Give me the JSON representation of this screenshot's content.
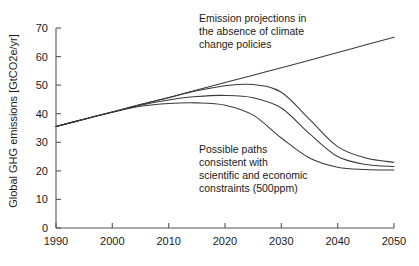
{
  "chart_data": {
    "type": "line",
    "title": "",
    "xlabel": "",
    "ylabel": "Global GHG emissions [GtCO2e/yr]",
    "xlim": [
      1990,
      2050
    ],
    "ylim": [
      0,
      70
    ],
    "xticks": [
      "1990",
      "2000",
      "2010",
      "2020",
      "2030",
      "2040",
      "2050"
    ],
    "yticks": [
      "0",
      "10",
      "20",
      "30",
      "40",
      "50",
      "60",
      "70"
    ],
    "grid": false,
    "legend": "none",
    "x": [
      1990,
      1995,
      2000,
      2005,
      2010,
      2015,
      2020,
      2025,
      2030,
      2035,
      2040,
      2045,
      2050
    ],
    "series": [
      {
        "name": "Emission projections in the absence of climate change policies",
        "values": [
          35.5,
          38.1,
          40.6,
          43.2,
          45.7,
          48.3,
          50.9,
          53.5,
          56.1,
          58.7,
          61.4,
          64.1,
          66.8
        ]
      },
      {
        "name": "Possible path A (late peak, 500ppm)",
        "values": [
          35.5,
          38.1,
          40.6,
          43.2,
          45.6,
          48.0,
          49.8,
          50.2,
          47.5,
          38.0,
          28.5,
          24.5,
          23.0
        ]
      },
      {
        "name": "Possible path B (mid peak, 500ppm)",
        "values": [
          35.5,
          38.1,
          40.6,
          43.0,
          44.8,
          46.0,
          46.4,
          45.6,
          42.0,
          33.0,
          25.0,
          22.2,
          21.5
        ]
      },
      {
        "name": "Possible path C (early peak, 500ppm)",
        "values": [
          35.5,
          38.1,
          40.5,
          42.6,
          43.6,
          43.8,
          43.0,
          39.5,
          31.5,
          24.5,
          21.3,
          20.5,
          20.3
        ]
      }
    ],
    "annotations": [
      {
        "name": "baseline-annotation",
        "lines": [
          "Emission projections in",
          "the absence of climate",
          "change policies"
        ]
      },
      {
        "name": "mitigation-annotation",
        "lines": [
          "Possible paths",
          "consistent with",
          "scientific and economic",
          "constraints (500ppm)"
        ]
      }
    ]
  },
  "caption": {
    "text": ""
  }
}
